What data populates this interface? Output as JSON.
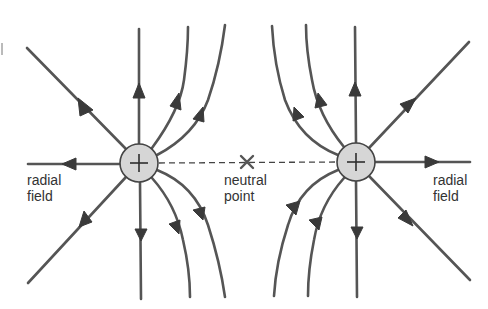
{
  "diagram": {
    "colors": {
      "field_line": "#555555",
      "arrow": "#3a3a3a",
      "charge_fill": "#d6d6d6",
      "charge_stroke": "#444444",
      "text": "#333333",
      "background": "#ffffff"
    },
    "charges": [
      {
        "id": "left",
        "sign": "+",
        "symbol": "+",
        "cx": 139,
        "cy": 163,
        "r": 19
      },
      {
        "id": "right",
        "sign": "+",
        "symbol": "+",
        "cx": 356,
        "cy": 162,
        "r": 19
      }
    ],
    "labels": {
      "left_radial_line1": "radial",
      "left_radial_line2": "field",
      "neutral_line1": "neutral",
      "neutral_line2": "point",
      "right_radial_line1": "radial",
      "right_radial_line2": "field"
    },
    "neutral_point": {
      "x": 247,
      "y": 162,
      "marker": "×"
    },
    "field_line_direction": "outward from positive charges"
  }
}
